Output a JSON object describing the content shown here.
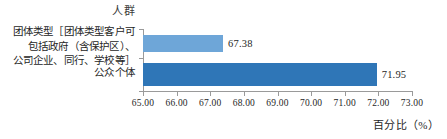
{
  "chart_data": {
    "type": "bar",
    "orientation": "horizontal",
    "title": "人群",
    "xlabel": "百分比（%）",
    "ylabel": "",
    "categories": [
      "团体类型［团体类型客户可包括政府（含保护区）、公司企业、同行、学校等］",
      "公众个体"
    ],
    "values": [
      67.38,
      71.95
    ],
    "value_labels": [
      "67.38",
      "71.95"
    ],
    "bar_colors": [
      "#6ea6d8",
      "#2f76b7"
    ],
    "xlim": [
      65.0,
      73.0
    ],
    "xticks": [
      65.0,
      66.0,
      67.0,
      68.0,
      69.0,
      70.0,
      71.0,
      72.0,
      73.0
    ],
    "xtick_labels": [
      "65.00",
      "66.00",
      "67.00",
      "68.00",
      "69.00",
      "70.00",
      "71.00",
      "72.00",
      "73.00"
    ],
    "grid": false,
    "legend": false
  },
  "labels": {
    "category_0_lines": [
      "团体类型［团体类型客户可",
      "包括政府（含保护区）、",
      "公司企业、同行、学校等］"
    ],
    "category_1_lines": [
      "公众个体"
    ]
  }
}
